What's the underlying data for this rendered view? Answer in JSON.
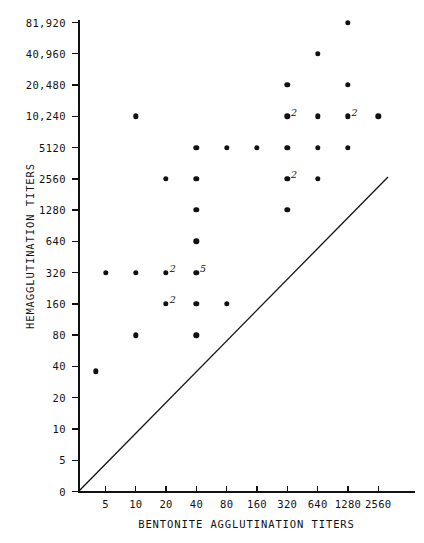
{
  "chart_data": {
    "type": "scatter",
    "title": "",
    "xlabel": "BENTONITE AGGLUTINATION TITERS",
    "ylabel": "HEMAGGLUTINATION TITERS",
    "x_ticks": [
      "5",
      "10",
      "20",
      "40",
      "80",
      "160",
      "320",
      "640",
      "1280",
      "2560"
    ],
    "x_tick_values": [
      5,
      10,
      20,
      40,
      80,
      160,
      320,
      640,
      1280,
      2560
    ],
    "y_ticks": [
      "0",
      "5",
      "10",
      "20",
      "40",
      "80",
      "160",
      "320",
      "640",
      "1280",
      "2560",
      "5120",
      "10,240",
      "20,480",
      "40,960",
      "81,920"
    ],
    "y_tick_values": [
      0,
      5,
      10,
      20,
      40,
      80,
      160,
      320,
      640,
      1280,
      2560,
      5120,
      10240,
      20480,
      40960,
      81920
    ],
    "grid": false,
    "legend": "none",
    "scale": "log2-like ordinal on both axes",
    "annotation": "diagonal line of identity drawn from origin upward to the right",
    "points": [
      {
        "x": 1280,
        "y": 81920,
        "count": 1,
        "label": ""
      },
      {
        "x": 640,
        "y": 40960,
        "count": 1,
        "label": ""
      },
      {
        "x": 320,
        "y": 20480,
        "count": 1,
        "label": ""
      },
      {
        "x": 1280,
        "y": 20480,
        "count": 1,
        "label": ""
      },
      {
        "x": 10,
        "y": 10240,
        "count": 1,
        "label": ""
      },
      {
        "x": 320,
        "y": 10240,
        "count": 2,
        "label": "2"
      },
      {
        "x": 640,
        "y": 10240,
        "count": 1,
        "label": ""
      },
      {
        "x": 1280,
        "y": 10240,
        "count": 2,
        "label": "2"
      },
      {
        "x": 2560,
        "y": 10240,
        "count": 1,
        "label": ""
      },
      {
        "x": 40,
        "y": 5120,
        "count": 1,
        "label": ""
      },
      {
        "x": 80,
        "y": 5120,
        "count": 1,
        "label": ""
      },
      {
        "x": 160,
        "y": 5120,
        "count": 1,
        "label": ""
      },
      {
        "x": 320,
        "y": 5120,
        "count": 1,
        "label": ""
      },
      {
        "x": 640,
        "y": 5120,
        "count": 1,
        "label": ""
      },
      {
        "x": 1280,
        "y": 5120,
        "count": 1,
        "label": ""
      },
      {
        "x": 20,
        "y": 2560,
        "count": 1,
        "label": ""
      },
      {
        "x": 40,
        "y": 2560,
        "count": 1,
        "label": ""
      },
      {
        "x": 320,
        "y": 2560,
        "count": 2,
        "label": "2"
      },
      {
        "x": 640,
        "y": 2560,
        "count": 1,
        "label": ""
      },
      {
        "x": 40,
        "y": 1280,
        "count": 1,
        "label": ""
      },
      {
        "x": 320,
        "y": 1280,
        "count": 1,
        "label": ""
      },
      {
        "x": 40,
        "y": 640,
        "count": 1,
        "label": ""
      },
      {
        "x": 5,
        "y": 320,
        "count": 1,
        "label": ""
      },
      {
        "x": 10,
        "y": 320,
        "count": 1,
        "label": ""
      },
      {
        "x": 20,
        "y": 320,
        "count": 2,
        "label": "2"
      },
      {
        "x": 40,
        "y": 320,
        "count": 5,
        "label": "5"
      },
      {
        "x": 20,
        "y": 160,
        "count": 2,
        "label": "2"
      },
      {
        "x": 40,
        "y": 160,
        "count": 1,
        "label": ""
      },
      {
        "x": 80,
        "y": 160,
        "count": 1,
        "label": ""
      },
      {
        "x": 10,
        "y": 80,
        "count": 1,
        "label": ""
      },
      {
        "x": 40,
        "y": 80,
        "count": 1,
        "label": ""
      },
      {
        "x": 4,
        "y": 36,
        "count": 1,
        "label": ""
      }
    ],
    "total_plotted_symbols": 32
  },
  "colors": {
    "ink": "#111111",
    "background": "#ffffff"
  }
}
